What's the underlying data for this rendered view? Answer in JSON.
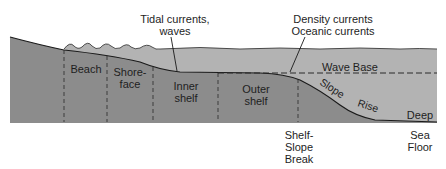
{
  "colors": {
    "land": "#8c8c8c",
    "water": "#b3b3b3",
    "outline": "#1a1a1a",
    "background": "#ffffff"
  },
  "annotations": {
    "tidal_line1": "Tidal currents,",
    "tidal_line2": "waves",
    "density_line1": "Density currents",
    "density_line2": "Oceanic currents",
    "wave_base": "Wave Base"
  },
  "zones": {
    "beach": "Beach",
    "shoreface_line1": "Shore-",
    "shoreface_line2": "face",
    "inner_shelf_line1": "Inner",
    "inner_shelf_line2": "shelf",
    "outer_shelf_line1": "Outer",
    "outer_shelf_line2": "shelf",
    "slope": "Slope",
    "rise": "Rise",
    "deep": "Deep"
  },
  "bottom_labels": {
    "shelf_break_line1": "Shelf-",
    "shelf_break_line2": "Slope",
    "shelf_break_line3": "Break",
    "sea_floor_line1": "Sea",
    "sea_floor_line2": "Floor"
  }
}
